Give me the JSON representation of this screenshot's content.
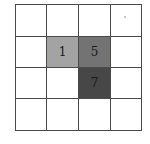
{
  "diagram": {
    "type": "grid",
    "rows": 4,
    "cols": 4,
    "border_color": "#4a4a4a",
    "cells": [
      {
        "row": 0,
        "col": 0,
        "label": "",
        "fill": "#ffffff"
      },
      {
        "row": 0,
        "col": 1,
        "label": "",
        "fill": "#ffffff"
      },
      {
        "row": 0,
        "col": 2,
        "label": "",
        "fill": "#ffffff"
      },
      {
        "row": 0,
        "col": 3,
        "label": "",
        "fill": "#ffffff",
        "mark": "dot"
      },
      {
        "row": 1,
        "col": 0,
        "label": "",
        "fill": "#ffffff"
      },
      {
        "row": 1,
        "col": 1,
        "label": "1",
        "fill": "#a3a3a3"
      },
      {
        "row": 1,
        "col": 2,
        "label": "5",
        "fill": "#737373"
      },
      {
        "row": 1,
        "col": 3,
        "label": "",
        "fill": "#ffffff"
      },
      {
        "row": 2,
        "col": 0,
        "label": "",
        "fill": "#ffffff"
      },
      {
        "row": 2,
        "col": 1,
        "label": "",
        "fill": "#ffffff"
      },
      {
        "row": 2,
        "col": 2,
        "label": "7",
        "fill": "#474747"
      },
      {
        "row": 2,
        "col": 3,
        "label": "",
        "fill": "#ffffff"
      },
      {
        "row": 3,
        "col": 0,
        "label": "",
        "fill": "#ffffff"
      },
      {
        "row": 3,
        "col": 1,
        "label": "",
        "fill": "#ffffff"
      },
      {
        "row": 3,
        "col": 2,
        "label": "",
        "fill": "#ffffff"
      },
      {
        "row": 3,
        "col": 3,
        "label": "",
        "fill": "#ffffff"
      }
    ]
  }
}
